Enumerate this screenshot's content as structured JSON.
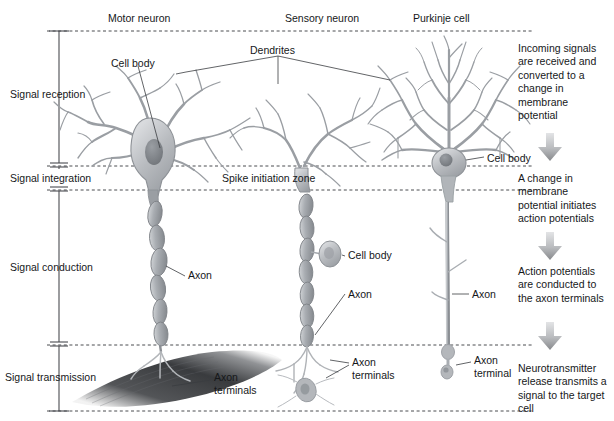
{
  "figure": {
    "background": "#ffffff",
    "ink": "#16181a",
    "neuron_fill": "#b9bcc0",
    "neuron_stroke": "#8d9196",
    "nucleus": "#7c8085",
    "muscle_dark": "#3a3c3f",
    "dashed_color": "#4a4c50",
    "bracket_color": "#4a4c50",
    "arrow_color": "#a7a9ac"
  },
  "column_headers": [
    {
      "label": "Motor neuron",
      "x": 108,
      "y": 12
    },
    {
      "label": "Sensory neuron",
      "x": 285,
      "y": 12
    },
    {
      "label": "Purkinje cell",
      "x": 413,
      "y": 12
    }
  ],
  "stages": [
    {
      "name": "Signal reception",
      "label": "Signal reception",
      "y_top": 31,
      "y_bottom": 166,
      "text_y": 88
    },
    {
      "name": "Signal integration",
      "label": "Signal integration",
      "y_top": 166,
      "y_bottom": 190,
      "text_y": 172
    },
    {
      "name": "Signal conduction",
      "label": "Signal conduction",
      "y_top": 190,
      "y_bottom": 345,
      "text_y": 261
    },
    {
      "name": "Signal transmission",
      "label": "Signal transmission",
      "y_top": 345,
      "y_bottom": 411,
      "text_y": 371
    }
  ],
  "callouts": [
    {
      "name": "dendrites",
      "label": "Dendrites",
      "x": 278,
      "y": 44
    },
    {
      "name": "cell-body-motor",
      "label": "Cell body",
      "x": 111,
      "y": 57
    },
    {
      "name": "spike-initiation",
      "label": "Spike initiation zone",
      "x": 222,
      "y": 172
    },
    {
      "name": "cell-body-purkinje",
      "label": "Cell body",
      "x": 487,
      "y": 150
    },
    {
      "name": "axon-motor",
      "label": "Axon",
      "x": 188,
      "y": 273
    },
    {
      "name": "cell-body-sensory",
      "label": "Cell body",
      "x": 348,
      "y": 252
    },
    {
      "name": "axon-sensory",
      "label": "Axon",
      "x": 348,
      "y": 291
    },
    {
      "name": "axon-purkinje",
      "label": "Axon",
      "x": 472,
      "y": 291
    },
    {
      "name": "axon-terminals-motor",
      "label": "Axon\nterminals",
      "x": 214,
      "y": 378
    },
    {
      "name": "axon-terminals-sensory",
      "label": "Axon\nterminals",
      "x": 352,
      "y": 360
    },
    {
      "name": "axon-terminal-purkinje",
      "label": "Axon\nterminal",
      "x": 474,
      "y": 358
    }
  ],
  "callout_labels": {
    "dendrites": "Dendrites",
    "cell_body": "Cell body",
    "spike_initiation_zone": "Spike initiation zone",
    "axon": "Axon",
    "axon_terminals": "Axon",
    "axon_terminals_2": "terminals",
    "axon_terminal_2": "terminal"
  },
  "right_column": {
    "steps": [
      {
        "text": "Incoming signals are received and converted to a change in membrane potential",
        "y": 42
      },
      {
        "text": "A change in membrane potential initiates action potentials",
        "y": 172
      },
      {
        "text": "Action potentials are conducted to the axon terminals",
        "y": 265
      },
      {
        "text": "Neurotransmitter release transmits a signal to the target cell",
        "y": 362
      }
    ],
    "arrows": [
      {
        "name": "flow-arrow-1",
        "y": 133
      },
      {
        "name": "flow-arrow-2",
        "y": 232
      },
      {
        "name": "flow-arrow-3",
        "y": 322
      }
    ]
  }
}
